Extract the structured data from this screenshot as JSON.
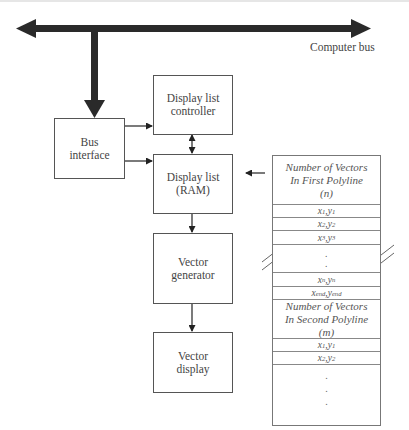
{
  "diagram": {
    "bus_label": "Computer bus",
    "blocks": {
      "bus_interface": [
        "Bus",
        "interface"
      ],
      "display_list_controller": [
        "Display list",
        "controller"
      ],
      "display_list_ram": [
        "Display list",
        "(RAM)"
      ],
      "vector_generator": [
        "Vector",
        "generator"
      ],
      "vector_display": [
        "Vector",
        "display"
      ]
    },
    "connections": [
      {
        "from": "computer_bus",
        "to": "bus_interface",
        "type": "thick-arrow"
      },
      {
        "from": "bus_interface",
        "to": "display_list_controller",
        "type": "arrow"
      },
      {
        "from": "bus_interface",
        "to": "display_list_ram",
        "type": "arrow"
      },
      {
        "from": "display_list_controller",
        "to": "display_list_ram",
        "type": "bidirectional"
      },
      {
        "from": "display_list_ram",
        "to": "vector_generator",
        "type": "arrow"
      },
      {
        "from": "vector_generator",
        "to": "vector_display",
        "type": "arrow"
      },
      {
        "from": "display_list_table",
        "to": "display_list_ram",
        "type": "arrow"
      }
    ],
    "table": {
      "first_header": [
        "Number of Vectors",
        "In First Polyline",
        "(n)"
      ],
      "first_rows": [
        {
          "x": "x",
          "xs": "1",
          "y": "y",
          "ys": "1"
        },
        {
          "x": "x",
          "xs": "2",
          "y": "y",
          "ys": "2"
        },
        {
          "x": "x",
          "xs": "3",
          "y": "y",
          "ys": "3"
        }
      ],
      "last_rows": [
        {
          "x": "x",
          "xs": "n",
          "y": "y",
          "ys": "n"
        },
        {
          "x": "x",
          "xs": "end",
          "y": "y",
          "ys": "end"
        }
      ],
      "second_header": [
        "Number of Vectors",
        "In Second Polyline",
        "(m)"
      ],
      "second_rows": [
        {
          "x": "x",
          "xs": "1",
          "y": "y",
          "ys": "1"
        },
        {
          "x": "x",
          "xs": "2",
          "y": "y",
          "ys": "2"
        }
      ],
      "ellipsis": "."
    }
  }
}
